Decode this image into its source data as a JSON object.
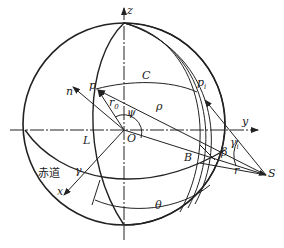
{
  "diagram": {
    "type": "celestial sphere geometry",
    "labels": {
      "z": "z",
      "y": "y",
      "x": "x",
      "n": "n",
      "p": "p",
      "r0": "r",
      "r0_sub": "0",
      "psi": "ψ",
      "C": "C",
      "rho": "ρ",
      "pi": "p",
      "pi_sub": "i",
      "O": "O",
      "L": "L",
      "gamma": "γ",
      "equator": "赤道",
      "B": "B",
      "beta": "β",
      "gamma_i": "γ",
      "gamma_i_sub": "i",
      "r": "r",
      "S": "S",
      "theta": "θ"
    },
    "colors": {
      "line": "#222222",
      "background": "#ffffff"
    }
  }
}
